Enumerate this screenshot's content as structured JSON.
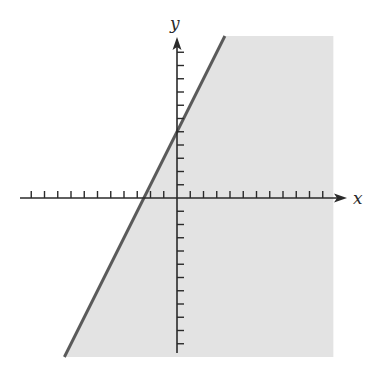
{
  "figure": {
    "x_axis_label": "x",
    "y_axis_label": "y",
    "colors": {
      "shade": "#e3e3e3",
      "boundary_line": "#5a5a5a",
      "axes": "#2a2a2a"
    }
  },
  "chart_data": {
    "type": "area",
    "title": "",
    "xlabel": "x",
    "ylabel": "y",
    "xlim": [
      -11.5,
      12.5
    ],
    "ylim": [
      -11.9,
      12
    ],
    "x_ticks": [
      -11,
      -10,
      -9,
      -8,
      -7,
      -6,
      -5,
      -4,
      -3,
      -2,
      -1,
      1,
      2,
      3,
      4,
      5,
      6,
      7,
      8,
      9,
      10,
      11
    ],
    "y_ticks": [
      -11,
      -10,
      -9,
      -8,
      -7,
      -6,
      -5,
      -4,
      -3,
      -2,
      -1,
      1,
      2,
      3,
      4,
      5,
      6,
      7,
      8,
      9,
      10,
      11
    ],
    "tick_labels_shown": false,
    "grid": false,
    "boundary": {
      "equation": "y = 2x + 5",
      "slope": 2,
      "intercept": 5,
      "style": "solid"
    },
    "shaded_region": {
      "inequality": "y <= 2x + 5",
      "side": "below-right",
      "x_max": 11.8
    }
  }
}
